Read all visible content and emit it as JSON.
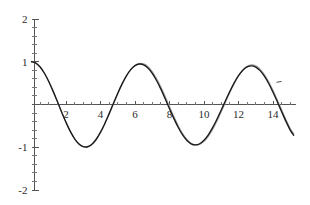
{
  "chart_data": {
    "type": "line",
    "title": "",
    "subtitle": "",
    "xlabel": "",
    "ylabel": "",
    "xlim": [
      -0.15,
      15.3
    ],
    "ylim": [
      -2,
      2
    ],
    "grid": false,
    "legend": "none",
    "x_ticks_major": [
      2,
      4,
      6,
      8,
      10,
      12,
      14
    ],
    "x_tick_labels": [
      "2",
      "4",
      "6",
      "8",
      "10",
      "12",
      "14"
    ],
    "x_ticks_minor_step": 0.5,
    "y_ticks_major": [
      2,
      1,
      -1,
      -2
    ],
    "y_tick_labels": [
      "2",
      "1",
      "-1",
      "-2"
    ],
    "y_ticks_minor_step": 0.2,
    "axis_origin": [
      0,
      0
    ],
    "series": [
      {
        "name": "reference-curve",
        "color": "#9a9a9a",
        "style": "solid",
        "description": "cos-like oscillation, amplitude 1, period 6.28, gradually lagging phase",
        "x": [
          0,
          0.25,
          0.5,
          0.75,
          1,
          1.25,
          1.5,
          1.75,
          2,
          2.25,
          2.5,
          2.75,
          3,
          3.25,
          3.5,
          3.75,
          4,
          4.25,
          4.5,
          4.75,
          5,
          5.25,
          5.5,
          5.75,
          6,
          6.25,
          6.5,
          6.75,
          7,
          7.25,
          7.5,
          7.75,
          8,
          8.25,
          8.5,
          8.75,
          9,
          9.25,
          9.5,
          9.75,
          10,
          10.25,
          10.5,
          10.75,
          11,
          11.25,
          11.5,
          11.75,
          12,
          12.25,
          12.5,
          12.75,
          13,
          13.25,
          13.5,
          13.75,
          14,
          14.25,
          14.5,
          14.75,
          15,
          15.2
        ],
        "y": [
          1.0,
          0.969,
          0.878,
          0.732,
          0.54,
          0.315,
          0.071,
          -0.178,
          -0.416,
          -0.629,
          -0.802,
          -0.925,
          -0.99,
          -0.995,
          -0.939,
          -0.826,
          -0.663,
          -0.461,
          -0.232,
          0.009,
          0.247,
          0.468,
          0.66,
          0.81,
          0.912,
          0.96,
          0.951,
          0.887,
          0.771,
          0.609,
          0.411,
          0.188,
          -0.046,
          -0.277,
          -0.49,
          -0.673,
          -0.815,
          -0.908,
          -0.948,
          -0.933,
          -0.864,
          -0.745,
          -0.583,
          -0.387,
          -0.169,
          0.06,
          0.285,
          0.492,
          0.67,
          0.806,
          0.893,
          0.927,
          0.905,
          0.829,
          0.703,
          0.534,
          0.332,
          0.108,
          -0.125,
          -0.353,
          -0.563,
          -0.687
        ]
      },
      {
        "name": "solution-curve",
        "color": "#1a1a1a",
        "style": "solid",
        "description": "numerical solution tracking the reference, advancing slightly in phase after x=8",
        "x": [
          0,
          0.25,
          0.5,
          0.75,
          1,
          1.25,
          1.5,
          1.75,
          2,
          2.25,
          2.5,
          2.75,
          3,
          3.25,
          3.5,
          3.75,
          4,
          4.25,
          4.5,
          4.75,
          5,
          5.25,
          5.5,
          5.75,
          6,
          6.25,
          6.5,
          6.75,
          7,
          7.25,
          7.5,
          7.75,
          8,
          8.25,
          8.5,
          8.75,
          9,
          9.25,
          9.5,
          9.75,
          10,
          10.25,
          10.5,
          10.75,
          11,
          11.25,
          11.5,
          11.75,
          12,
          12.25,
          12.5,
          12.75,
          13,
          13.25,
          13.5,
          13.75,
          14,
          14.25,
          14.5,
          14.75,
          15,
          15.2
        ],
        "y": [
          1.0,
          0.969,
          0.878,
          0.731,
          0.539,
          0.313,
          0.069,
          -0.18,
          -0.418,
          -0.63,
          -0.802,
          -0.923,
          -0.986,
          -0.988,
          -0.929,
          -0.813,
          -0.647,
          -0.443,
          -0.213,
          0.028,
          0.265,
          0.483,
          0.671,
          0.815,
          0.909,
          0.947,
          0.928,
          0.854,
          0.729,
          0.561,
          0.359,
          0.135,
          -0.098,
          -0.325,
          -0.532,
          -0.706,
          -0.838,
          -0.919,
          -0.946,
          -0.918,
          -0.838,
          -0.71,
          -0.542,
          -0.345,
          -0.13,
          0.092,
          0.308,
          0.506,
          0.674,
          0.8,
          0.878,
          0.903,
          0.874,
          0.792,
          0.662,
          0.491,
          0.288,
          0.064,
          -0.168,
          -0.394,
          -0.6,
          -0.72
        ]
      }
    ],
    "annotations": [
      {
        "name": "stray-tick-mark",
        "x": 14.35,
        "y": 0.52,
        "text": ""
      }
    ]
  },
  "figure": {
    "background_color": "#ffffff",
    "axis_color": "#555555",
    "label_color": "#2b2b2b",
    "reference_color": "#9a9a9a",
    "solution_color": "#1a1a1a"
  }
}
